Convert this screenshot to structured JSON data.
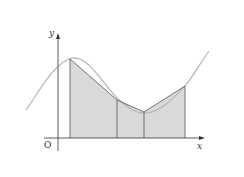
{
  "diagram": {
    "labels": {
      "y_axis": "y",
      "x_axis": "x",
      "origin": "O"
    },
    "colors": {
      "fill": "#d9d9d9",
      "curve": "#b0b0b0",
      "lines": "#555555",
      "axis": "#333333"
    },
    "strips": 3,
    "ordinates_x": [
      70,
      117,
      144,
      185
    ],
    "ordinates_y": [
      59,
      100,
      112,
      86
    ]
  }
}
